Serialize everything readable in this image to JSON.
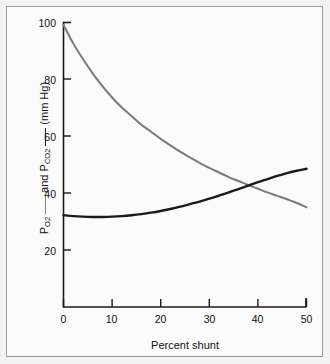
{
  "figure": {
    "background_color": "#f3f3f3",
    "panel_color": "#fbfbfb",
    "border_color": "#9a9a9a"
  },
  "axes": {
    "x_title": "Percent shunt",
    "y_title_parts": {
      "p_label": "P",
      "o2_sub": "O",
      "o2_sub_num": "2",
      "conjunction": "and",
      "pco2_label": "P",
      "co2_sub": "CO",
      "co2_sub_num": "2",
      "units": "(mm Hg)"
    },
    "y_title_plain": "PO2 — and PCO2 — (mm Hg)",
    "x_ticks": [
      "0",
      "10",
      "20",
      "30",
      "40",
      "50"
    ],
    "y_ticks": [
      "20",
      "40",
      "60",
      "80",
      "100"
    ]
  },
  "chart_data": {
    "type": "line",
    "title": "",
    "subtitle": "",
    "xlabel": "Percent shunt",
    "ylabel": "PO2 — and PCO2 — (mm Hg)",
    "xlim": [
      0,
      50
    ],
    "ylim": [
      0,
      100
    ],
    "xticks": [
      0,
      10,
      20,
      30,
      40,
      50
    ],
    "yticks": [
      20,
      40,
      60,
      80,
      100
    ],
    "grid": false,
    "legend_position": "none",
    "annotations": [
      "Curves cross at approximately 39 percent shunt and 41 mm Hg",
      "PO2 is the gray curve, PCO2 is the black curve"
    ],
    "x": [
      0,
      2,
      4,
      6,
      8,
      10,
      12,
      14,
      16,
      18,
      20,
      22,
      24,
      26,
      28,
      30,
      32,
      34,
      36,
      38,
      40,
      42,
      44,
      46,
      48,
      50
    ],
    "series": [
      {
        "name": "PO2",
        "color": "#7a7a7a",
        "units": "mm Hg",
        "values": [
          99,
          92.5,
          87,
          82,
          77.5,
          73.5,
          70,
          67,
          64,
          61.5,
          59,
          56.7,
          54.5,
          52.5,
          50.6,
          48.8,
          47.2,
          45.6,
          44.2,
          42.8,
          41.5,
          40.2,
          39.0,
          37.8,
          36.5,
          35.0
        ]
      },
      {
        "name": "PCO2",
        "color": "#1a1a1a",
        "units": "mm Hg",
        "values": [
          32.2,
          31.9,
          31.7,
          31.6,
          31.6,
          31.7,
          31.9,
          32.2,
          32.6,
          33.1,
          33.7,
          34.4,
          35.2,
          36.1,
          37.0,
          38.0,
          39.1,
          40.2,
          41.4,
          42.6,
          43.8,
          44.9,
          46.0,
          47.0,
          47.8,
          48.5
        ]
      }
    ]
  }
}
